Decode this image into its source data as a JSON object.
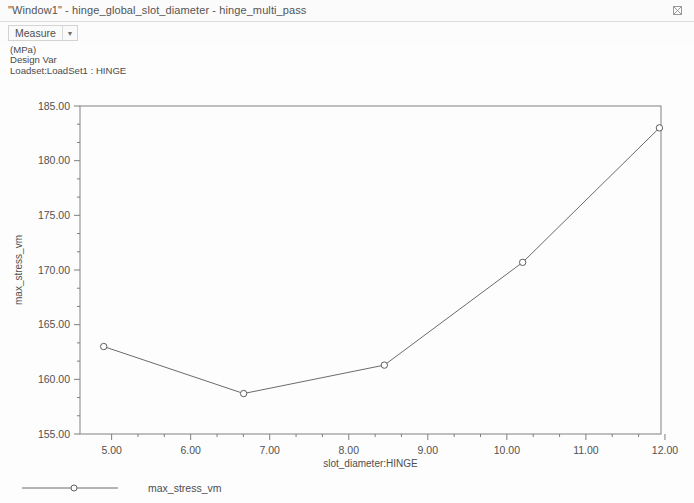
{
  "window": {
    "title": "\"Window1\" - hinge_global_slot_diameter - hinge_multi_pass",
    "corner_icon": "restore-window-icon"
  },
  "toolbar": {
    "measure_label": "Measure",
    "dropdown_arrow": "chevron-down-icon"
  },
  "header_info": {
    "units": "(MPa)",
    "design_var": "Design Var",
    "loadset": "Loadset:LoadSet1 : HINGE"
  },
  "chart_data": {
    "type": "line",
    "title": "",
    "xlabel": "slot_diameter:HINGE",
    "ylabel": "max_stress_vm",
    "xlim": [
      4.6,
      11.95
    ],
    "ylim": [
      155.0,
      185.0
    ],
    "xticks": [
      5.0,
      6.0,
      7.0,
      8.0,
      9.0,
      10.0,
      11.0,
      12.0
    ],
    "xtick_labels": [
      "5.00",
      "6.00",
      "7.00",
      "8.00",
      "9.00",
      "10.00",
      "11.00",
      "12.00"
    ],
    "yticks": [
      155.0,
      160.0,
      165.0,
      170.0,
      175.0,
      180.0,
      185.0
    ],
    "ytick_labels": [
      "155.00",
      "160.00",
      "165.00",
      "170.00",
      "175.00",
      "180.00",
      "185.00"
    ],
    "minor_ticks_per_interval": 2,
    "grid": false,
    "legend_position": "bottom-left",
    "series": [
      {
        "name": "max_stress_vm",
        "marker": "circle",
        "color": "#6b6b6b",
        "x": [
          4.9,
          6.67,
          8.45,
          10.2,
          11.93
        ],
        "y": [
          163.0,
          158.7,
          161.3,
          170.7,
          183.0
        ]
      }
    ]
  },
  "legend": {
    "entries": [
      {
        "label": "max_stress_vm",
        "marker": "circle",
        "color": "#6b6b6b"
      }
    ]
  }
}
